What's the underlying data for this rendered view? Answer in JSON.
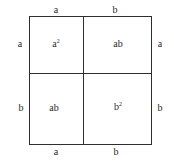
{
  "diagram": {
    "type": "area-model",
    "top_labels": [
      "a",
      "b"
    ],
    "bottom_labels": [
      "a",
      "b"
    ],
    "left_labels": [
      "a",
      "b"
    ],
    "right_labels": [
      "a",
      "b"
    ],
    "cells": [
      {
        "id": "top-left",
        "base": "a",
        "sup": "2"
      },
      {
        "id": "top-right",
        "base": "ab",
        "sup": ""
      },
      {
        "id": "bottom-left",
        "base": "ab",
        "sup": ""
      },
      {
        "id": "bottom-right",
        "base": "b",
        "sup": "2"
      }
    ],
    "line_color": "#2e2e2e",
    "text_color": "#2a2a2a"
  }
}
